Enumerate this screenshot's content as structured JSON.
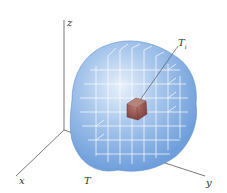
{
  "figure": {
    "axes": {
      "z_label": "z",
      "x_label": "x",
      "y_label": "y",
      "axis_color": "#555555"
    },
    "solid": {
      "label": "T",
      "fill_color": "#7fa9de",
      "edge_color": "#5e8fd0"
    },
    "subbox": {
      "label_main": "T",
      "label_sub": "i",
      "fill_color": "#9a5a52"
    },
    "grid_line_color": "#ffffff"
  }
}
